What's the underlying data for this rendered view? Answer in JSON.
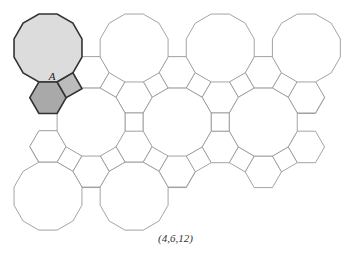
{
  "caption": "(4,6,12)",
  "label": "A",
  "colors": {
    "stroke": "#9a9a9a",
    "highlight_stroke": "#333333",
    "dodecagon_fill": "#dcdcdc",
    "hexagon_fill": "#a9a9a9",
    "square_fill": "#bcbcbc"
  },
  "dodecagons": [
    [
      48,
      48
    ],
    [
      134,
      47
    ],
    [
      220,
      47
    ],
    [
      306,
      46
    ],
    [
      91,
      125
    ],
    [
      177,
      125
    ],
    [
      263,
      125
    ],
    [
      134,
      203
    ],
    [
      220,
      203
    ]
  ],
  "hexagons": [
    [
      48,
      97
    ],
    [
      91,
      73
    ],
    [
      177,
      72
    ],
    [
      263,
      72
    ],
    [
      306,
      94
    ],
    [
      134,
      99
    ],
    [
      220,
      99
    ],
    [
      48,
      149
    ],
    [
      91,
      177
    ],
    [
      177,
      150
    ],
    [
      263,
      150
    ],
    [
      306,
      148
    ],
    [
      134,
      177
    ],
    [
      220,
      177
    ],
    [
      306,
      100
    ]
  ],
  "squares": [
    [
      78,
      98
    ],
    [
      91,
      109
    ]
  ]
}
